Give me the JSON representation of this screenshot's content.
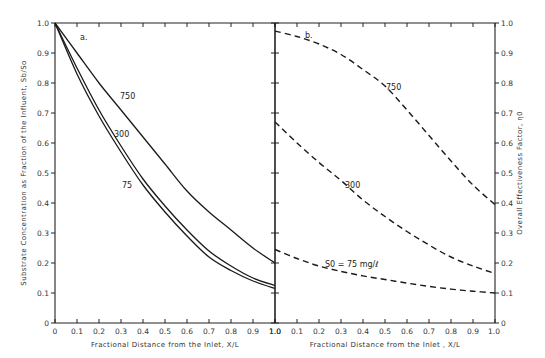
{
  "chart_data": [
    {
      "type": "line",
      "panel_label": "a.",
      "xlabel": "Fractional Distance from the Inlet,  X/L",
      "ylabel": "Substrate Concentration as Fraction of the Influent,  Sb/So",
      "xlim": [
        0,
        1.0
      ],
      "ylim": [
        0,
        1.0
      ],
      "x_ticks": [
        "0",
        "0.1",
        "0.2",
        "0.3",
        "0.4",
        "0.5",
        "0.6",
        "0.7",
        "0.8",
        "0.9",
        "1.0"
      ],
      "y_ticks": [
        "0",
        "0.1",
        "0.2",
        "0.3",
        "0.4",
        "0.5",
        "0.6",
        "0.7",
        "0.8",
        "0.9",
        "1.0"
      ],
      "grid": false,
      "line_style": "solid",
      "series": [
        {
          "name": "750",
          "x": [
            0,
            0.1,
            0.2,
            0.3,
            0.4,
            0.5,
            0.6,
            0.7,
            0.8,
            0.9,
            1.0
          ],
          "values": [
            1.0,
            0.9,
            0.8,
            0.71,
            0.62,
            0.53,
            0.44,
            0.37,
            0.31,
            0.25,
            0.2
          ]
        },
        {
          "name": "300",
          "x": [
            0,
            0.1,
            0.2,
            0.3,
            0.4,
            0.5,
            0.6,
            0.7,
            0.8,
            0.9,
            1.0
          ],
          "values": [
            1.0,
            0.85,
            0.71,
            0.59,
            0.48,
            0.39,
            0.31,
            0.24,
            0.19,
            0.15,
            0.125
          ]
        },
        {
          "name": "75",
          "x": [
            0,
            0.1,
            0.2,
            0.3,
            0.4,
            0.5,
            0.6,
            0.7,
            0.8,
            0.9,
            1.0
          ],
          "values": [
            1.0,
            0.83,
            0.69,
            0.57,
            0.46,
            0.37,
            0.29,
            0.22,
            0.175,
            0.14,
            0.115
          ]
        }
      ]
    },
    {
      "type": "line",
      "panel_label": "b.",
      "xlabel": "Fractional Distance from the Inlet , X/L",
      "ylabel": "Overall Effectiveness Factor,  η0",
      "xlim": [
        0,
        1.0
      ],
      "ylim": [
        0,
        1.0
      ],
      "x_ticks": [
        "1.0",
        "0.1",
        "0.2",
        "0.3",
        "0.4",
        "0.5",
        "0.6",
        "0.7",
        "0.8",
        "0.9",
        "1.0"
      ],
      "y_ticks": [
        "0",
        "0.1",
        "0.2",
        "0.3",
        "0.4",
        "0.5",
        "0.6",
        "0.7",
        "0.8",
        "0.9",
        "1.0"
      ],
      "grid": false,
      "line_style": "dashed",
      "series": [
        {
          "name": "750",
          "x": [
            0,
            0.1,
            0.2,
            0.3,
            0.4,
            0.5,
            0.6,
            0.7,
            0.8,
            0.9,
            1.0
          ],
          "values": [
            0.973,
            0.955,
            0.93,
            0.895,
            0.845,
            0.79,
            0.71,
            0.625,
            0.54,
            0.46,
            0.395
          ]
        },
        {
          "name": "300",
          "x": [
            0,
            0.1,
            0.2,
            0.3,
            0.4,
            0.5,
            0.6,
            0.7,
            0.8,
            0.9,
            1.0
          ],
          "values": [
            0.67,
            0.6,
            0.535,
            0.475,
            0.41,
            0.355,
            0.305,
            0.26,
            0.22,
            0.19,
            0.165
          ]
        },
        {
          "name": "S0 = 75 mg/ℓ",
          "x": [
            0,
            0.1,
            0.2,
            0.3,
            0.4,
            0.5,
            0.6,
            0.7,
            0.8,
            0.9,
            1.0
          ],
          "values": [
            0.245,
            0.215,
            0.19,
            0.172,
            0.157,
            0.145,
            0.133,
            0.122,
            0.113,
            0.106,
            0.1
          ]
        }
      ]
    }
  ]
}
